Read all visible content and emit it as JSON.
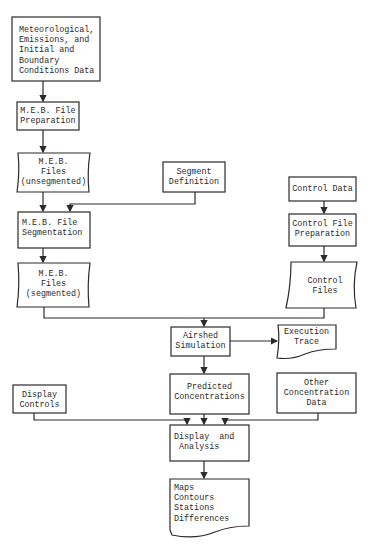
{
  "diagram": {
    "type": "flowchart",
    "colors": {
      "line": "#2a2a2a",
      "background": "#ffffff"
    },
    "nodes": {
      "input_data": {
        "shape": "process",
        "lines": [
          "Meteorological,",
          "Emissions, and",
          "Initial and",
          "Boundary",
          "Conditions Data"
        ]
      },
      "meb_prep": {
        "shape": "process",
        "lines": [
          "M.E.B. File",
          "Preparation"
        ]
      },
      "meb_unseg": {
        "shape": "data-file",
        "lines": [
          "M.E.B.",
          "Files",
          "(unsegmented)"
        ]
      },
      "segment_def": {
        "shape": "process",
        "lines": [
          "Segment",
          "Definition"
        ]
      },
      "meb_seg_proc": {
        "shape": "process",
        "lines": [
          "M.E.B. File",
          "Segmentation"
        ]
      },
      "meb_seg": {
        "shape": "data-file",
        "lines": [
          "M.E.B.",
          "Files",
          "(segmented)"
        ]
      },
      "control_data": {
        "shape": "process",
        "lines": [
          "Control Data"
        ]
      },
      "control_prep": {
        "shape": "process",
        "lines": [
          "Control File",
          "Preparation"
        ]
      },
      "control_files": {
        "shape": "data-file",
        "lines": [
          "Control",
          "Files"
        ]
      },
      "airshed": {
        "shape": "process",
        "lines": [
          "Airshed",
          "Simulation"
        ]
      },
      "exec_trace": {
        "shape": "document",
        "lines": [
          "Execution",
          "Trace"
        ]
      },
      "predicted": {
        "shape": "process",
        "lines": [
          "Predicted",
          "Concentrations"
        ]
      },
      "other_conc": {
        "shape": "process",
        "lines": [
          "Other",
          "Concentration",
          "Data"
        ]
      },
      "display_controls": {
        "shape": "process",
        "lines": [
          "Display",
          "Controls"
        ]
      },
      "display_analysis": {
        "shape": "process",
        "lines": [
          "Display  and",
          " Analysis"
        ]
      },
      "outputs": {
        "shape": "document",
        "lines": [
          "Maps",
          "Contours",
          "Stations",
          "Differences"
        ]
      }
    },
    "edges": [
      [
        "input_data",
        "meb_prep"
      ],
      [
        "meb_prep",
        "meb_unseg"
      ],
      [
        "meb_unseg",
        "meb_seg_proc"
      ],
      [
        "segment_def",
        "meb_seg_proc"
      ],
      [
        "meb_seg_proc",
        "meb_seg"
      ],
      [
        "control_data",
        "control_prep"
      ],
      [
        "control_prep",
        "control_files"
      ],
      [
        "meb_seg",
        "airshed"
      ],
      [
        "control_files",
        "airshed"
      ],
      [
        "airshed",
        "exec_trace"
      ],
      [
        "airshed",
        "predicted"
      ],
      [
        "predicted",
        "display_analysis"
      ],
      [
        "other_conc",
        "display_analysis"
      ],
      [
        "display_controls",
        "display_analysis"
      ],
      [
        "display_analysis",
        "outputs"
      ]
    ]
  },
  "text": {
    "input_data": "Meteorological,\nEmissions, and\nInitial and\nBoundary\nConditions Data",
    "meb_prep": "M.E.B. File\nPreparation",
    "meb_unseg": "M.E.B.\nFiles\n(unsegmented)",
    "segment_def": "Segment\nDefinition",
    "meb_seg_proc": "M.E.B. File\nSegmentation",
    "meb_seg": "M.E.B.\nFiles\n(segmented)",
    "control_data": "Control Data",
    "control_prep": "Control File\nPreparation",
    "control_files": "Control\nFiles",
    "airshed": "Airshed\nSimulation",
    "exec_trace": "Execution\nTrace",
    "predicted": "Predicted\nConcentrations",
    "other_conc": "Other\nConcentration\nData",
    "display_controls": "Display\nControls",
    "display_analysis": "Display  and\n Analysis",
    "outputs": "Maps\nContours\nStations\nDifferences"
  }
}
